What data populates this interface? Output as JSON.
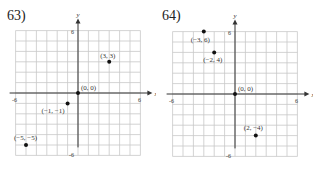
{
  "chart_data": [
    {
      "type": "scatter",
      "title": "63)",
      "xlabel": "x",
      "ylabel": "y",
      "xlim": [
        -6,
        6
      ],
      "ylim": [
        -6,
        6
      ],
      "grid": true,
      "tick_labels": {
        "x": [
          "-6",
          "6"
        ],
        "y": [
          "6",
          "-6"
        ]
      },
      "points": [
        {
          "x": 3,
          "y": 3,
          "label": "(3, 3)"
        },
        {
          "x": 0,
          "y": 0,
          "label": "(0, 0)"
        },
        {
          "x": -1,
          "y": -1,
          "label": "(−1, −1)"
        },
        {
          "x": -5,
          "y": -5,
          "label": "(−5, −5)"
        }
      ]
    },
    {
      "type": "scatter",
      "title": "64)",
      "xlabel": "x",
      "ylabel": "y",
      "xlim": [
        -6,
        6
      ],
      "ylim": [
        -6,
        6
      ],
      "grid": true,
      "tick_labels": {
        "x": [
          "-6",
          "6"
        ],
        "y": [
          "6",
          "-6"
        ]
      },
      "points": [
        {
          "x": -3,
          "y": 6,
          "label": "(−3, 6)"
        },
        {
          "x": -2,
          "y": 4,
          "label": "(−2, 4)"
        },
        {
          "x": 0,
          "y": 0,
          "label": "(0, 0)"
        },
        {
          "x": 2,
          "y": -4,
          "label": "(2, −4)"
        }
      ]
    }
  ],
  "problems": [
    {
      "number": "63)"
    },
    {
      "number": "64)"
    }
  ],
  "colors": {
    "grid": "#c8c8c8",
    "axis": "#333333",
    "point": "#111111",
    "text": "#333333"
  }
}
